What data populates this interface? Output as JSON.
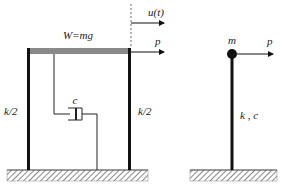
{
  "frame_model": {
    "weight_label": "W=mg",
    "displacement_label": "u(t)",
    "force_label": "p",
    "left_column_label": "k/2",
    "right_column_label": "k/2",
    "damper_label": "c"
  },
  "sdof_model": {
    "mass_label": "m",
    "force_label": "p",
    "stiffness_damping_label": "k , c"
  },
  "colors": {
    "line": "#111111",
    "beam": "#8a8a8a",
    "hatch": "#555555"
  }
}
